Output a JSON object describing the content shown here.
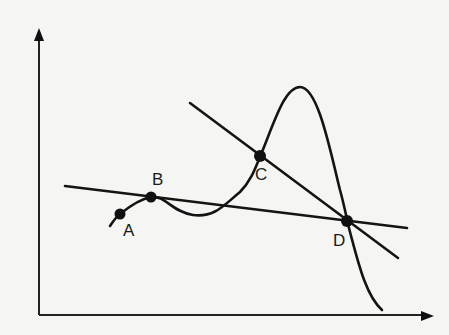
{
  "diagram": {
    "type": "function-graph-with-secant-and-tangent-lines",
    "axes": {
      "x_axis": {
        "has_arrow": true,
        "label": ""
      },
      "y_axis": {
        "has_arrow": true,
        "label": ""
      }
    },
    "curve": {
      "description": "wavy curve rising through A and B, dipping, rising steeply through C to a peak, then falling sharply through D"
    },
    "lines": [
      {
        "name": "line-BD",
        "description": "nearly horizontal line passing through B and D"
      },
      {
        "name": "line-CD",
        "description": "steep descending line passing through C and D"
      }
    ],
    "points": [
      {
        "label": "A",
        "x": 120,
        "y": 214
      },
      {
        "label": "B",
        "x": 151,
        "y": 197
      },
      {
        "label": "C",
        "x": 260,
        "y": 156
      },
      {
        "label": "D",
        "x": 347,
        "y": 221
      }
    ],
    "colors": {
      "background": "#f5f5f3",
      "ink": "#141414"
    }
  },
  "labels": {
    "A": "A",
    "B": "B",
    "C": "C",
    "D": "D"
  }
}
